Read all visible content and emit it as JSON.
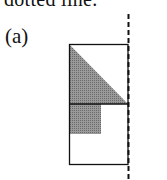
{
  "caption_fragment": "dotted line.",
  "panel_label": "(a)",
  "diagram": {
    "shapes": [
      "outer-rectangle",
      "midline",
      "shaded-triangle",
      "shaded-square",
      "dashed-vertical-line"
    ],
    "shade_color": "#8a8a8a",
    "line_color": "#111111"
  }
}
